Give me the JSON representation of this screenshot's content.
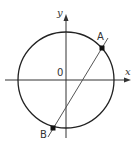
{
  "diagram": {
    "type": "circle-chord-coordinate-plane",
    "axes": {
      "x_label": "x",
      "y_label": "y",
      "origin_label": "0"
    },
    "circle": {
      "center": [
        66,
        80
      ],
      "radius": 48,
      "stroke": "#222222"
    },
    "points": [
      {
        "label": "A",
        "pos": [
          102,
          48
        ],
        "label_pos": [
          97,
          40
        ]
      },
      {
        "label": "B",
        "pos": [
          53,
          128
        ],
        "label_pos": [
          40,
          138
        ]
      }
    ],
    "line": {
      "from": [
        108,
        38
      ],
      "to": [
        48,
        137
      ],
      "stroke": "#555555"
    },
    "colors": {
      "axis": "#333333",
      "circle": "#222222",
      "line": "#555555",
      "point": "#111111"
    }
  }
}
